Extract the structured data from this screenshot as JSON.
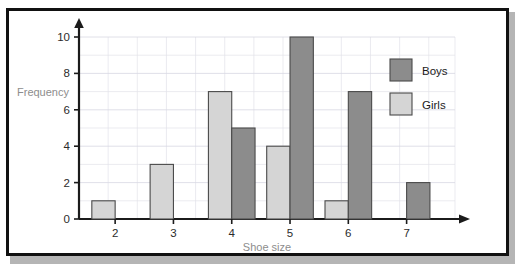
{
  "page": {
    "top_cut_text_left": "",
    "top_cut_text_right": ""
  },
  "chart_data": {
    "type": "bar",
    "title": "",
    "xlabel": "Shoe size",
    "ylabel": "Frequency",
    "categories": [
      "2",
      "3",
      "4",
      "5",
      "6",
      "7"
    ],
    "series": [
      {
        "name": "Girls",
        "values": [
          1,
          3,
          7,
          4,
          1,
          0
        ],
        "color": "#d5d5d5"
      },
      {
        "name": "Boys",
        "values": [
          0,
          0,
          5,
          10,
          7,
          2
        ],
        "color": "#8c8c8c"
      }
    ],
    "series_draw_order": [
      "Girls",
      "Boys"
    ],
    "ylim": [
      0,
      10
    ],
    "ytick_labels": [
      "0",
      "2",
      "4",
      "6",
      "8",
      "10"
    ],
    "ytick_values": [
      0,
      2,
      4,
      6,
      8,
      10
    ],
    "xtick_labels": [
      "2",
      "3",
      "4",
      "5",
      "6",
      "7"
    ],
    "grid": true,
    "grid_minor_step": 1,
    "legend_position": "top-right",
    "legend_entries": [
      {
        "label": "Boys",
        "color": "#8c8c8c"
      },
      {
        "label": "Girls",
        "color": "#d5d5d5"
      }
    ],
    "axis_arrows": {
      "x": "right",
      "y": "up"
    },
    "bar_edge_color": "#4a4a4a",
    "frame_color": "#111111",
    "background": "#ffffff"
  }
}
